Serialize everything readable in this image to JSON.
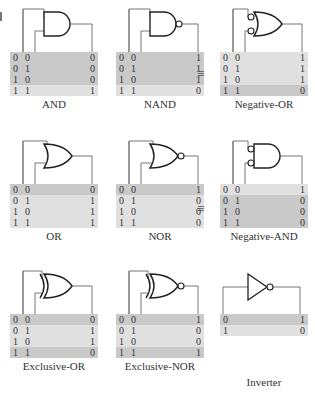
{
  "gates": [
    {
      "id": "and",
      "label": "AND",
      "type": "and",
      "inv_in": false,
      "inv_out": false,
      "rows": [
        [
          "0",
          "0",
          "0"
        ],
        [
          "0",
          "1",
          "0"
        ],
        [
          "1",
          "0",
          "0"
        ],
        [
          "1",
          "1",
          "1"
        ]
      ],
      "shade": [
        "dark",
        "dark",
        "dark",
        "light"
      ]
    },
    {
      "id": "nand",
      "label": "NAND",
      "type": "and",
      "inv_in": false,
      "inv_out": true,
      "rows": [
        [
          "0",
          "0",
          "1"
        ],
        [
          "0",
          "1",
          "1"
        ],
        [
          "1",
          "0",
          "1"
        ],
        [
          "1",
          "1",
          "0"
        ]
      ],
      "shade": [
        "dark",
        "dark",
        "dark",
        "light"
      ]
    },
    {
      "id": "negative-or",
      "label": "Negative-OR",
      "type": "or",
      "inv_in": true,
      "inv_out": false,
      "rows": [
        [
          "0",
          "0",
          "1"
        ],
        [
          "0",
          "1",
          "1"
        ],
        [
          "1",
          "0",
          "1"
        ],
        [
          "1",
          "1",
          "0"
        ]
      ],
      "shade": [
        "light",
        "light",
        "light",
        "dark"
      ]
    },
    {
      "id": "or",
      "label": "OR",
      "type": "or",
      "inv_in": false,
      "inv_out": false,
      "rows": [
        [
          "0",
          "0",
          "0"
        ],
        [
          "0",
          "1",
          "1"
        ],
        [
          "1",
          "0",
          "1"
        ],
        [
          "1",
          "1",
          "1"
        ]
      ],
      "shade": [
        "dark",
        "light",
        "light",
        "light"
      ]
    },
    {
      "id": "nor",
      "label": "NOR",
      "type": "or",
      "inv_in": false,
      "inv_out": true,
      "rows": [
        [
          "0",
          "0",
          "1"
        ],
        [
          "0",
          "1",
          "0"
        ],
        [
          "1",
          "0",
          "0"
        ],
        [
          "1",
          "1",
          "0"
        ]
      ],
      "shade": [
        "dark",
        "light",
        "light",
        "light"
      ]
    },
    {
      "id": "negative-and",
      "label": "Negative-AND",
      "type": "and",
      "inv_in": true,
      "inv_out": false,
      "rows": [
        [
          "0",
          "0",
          "1"
        ],
        [
          "0",
          "1",
          "0"
        ],
        [
          "1",
          "0",
          "0"
        ],
        [
          "1",
          "1",
          "0"
        ]
      ],
      "shade": [
        "light",
        "dark",
        "dark",
        "dark"
      ]
    },
    {
      "id": "exclusive-or",
      "label": "Exclusive-OR",
      "type": "xor",
      "inv_in": false,
      "inv_out": false,
      "rows": [
        [
          "0",
          "0",
          "0"
        ],
        [
          "0",
          "1",
          "1"
        ],
        [
          "1",
          "0",
          "1"
        ],
        [
          "1",
          "1",
          "0"
        ]
      ],
      "shade": [
        "dark",
        "light",
        "light",
        "dark"
      ]
    },
    {
      "id": "exclusive-nor",
      "label": "Exclusive-NOR",
      "type": "xor",
      "inv_in": false,
      "inv_out": true,
      "rows": [
        [
          "0",
          "0",
          "1"
        ],
        [
          "0",
          "1",
          "0"
        ],
        [
          "1",
          "0",
          "0"
        ],
        [
          "1",
          "1",
          "1"
        ]
      ],
      "shade": [
        "dark",
        "light",
        "light",
        "dark"
      ]
    },
    {
      "id": "inverter",
      "label": "Inverter",
      "type": "not",
      "inv_in": false,
      "inv_out": true,
      "rows": [
        [
          "0",
          "",
          "1"
        ],
        [
          "1",
          "",
          "0"
        ]
      ],
      "shade": [
        "dark",
        "light"
      ]
    }
  ],
  "equivalence_symbol": "≡",
  "colors": {
    "dark_row": "#c9c9c9",
    "light_row": "#e0e0e0",
    "wire": "#777777",
    "gate_stroke": "#222222"
  }
}
